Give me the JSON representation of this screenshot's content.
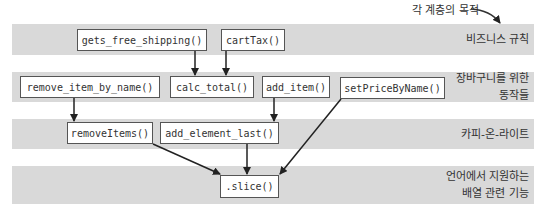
{
  "annotation": {
    "text": "각 계층의 목적"
  },
  "layers": [
    {
      "label_lines": [
        "비즈니스 규칙"
      ]
    },
    {
      "label_lines": [
        "장바구니를 위한",
        "동작들"
      ]
    },
    {
      "label_lines": [
        "카피-온-라이트"
      ]
    },
    {
      "label_lines": [
        "언어에서 지원하는",
        "배열 관련 기능"
      ]
    }
  ],
  "functions": {
    "gets_free_shipping": "gets_free_shipping()",
    "cartTax": "cartTax()",
    "remove_item_by_name": "remove_item_by_name()",
    "calc_total": "calc_total()",
    "add_item": "add_item()",
    "setPriceByName": "setPriceByName()",
    "removeItems": "removeItems()",
    "add_element_last": "add_element_last()",
    "slice": ".slice()"
  },
  "edges": [
    {
      "from": "gets_free_shipping()",
      "to": "calc_total()"
    },
    {
      "from": "cartTax()",
      "to": "calc_total()"
    },
    {
      "from": "remove_item_by_name()",
      "to": "removeItems()"
    },
    {
      "from": "add_item()",
      "to": "add_element_last()"
    },
    {
      "from": "setPriceByName()",
      "to": ".slice()"
    },
    {
      "from": "removeItems()",
      "to": ".slice()"
    },
    {
      "from": "add_element_last()",
      "to": ".slice()"
    }
  ],
  "colors": {
    "band": "#d9d9d9",
    "box_border": "#555555",
    "arrow": "#222222"
  }
}
